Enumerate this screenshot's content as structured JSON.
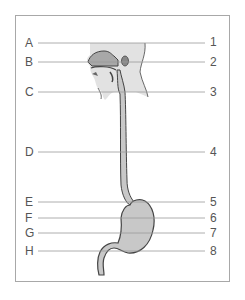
{
  "diagram": {
    "type": "anatomy-labeling",
    "colors": {
      "fill": "#c8c8c8",
      "outline": "#444444",
      "head_fill": "#e2e2e2",
      "leader": "#999999",
      "frame": "#a8a8a8"
    },
    "left_labels": [
      {
        "text": "A",
        "y": 43
      },
      {
        "text": "B",
        "y": 62
      },
      {
        "text": "C",
        "y": 92
      },
      {
        "text": "D",
        "y": 152
      },
      {
        "text": "E",
        "y": 202
      },
      {
        "text": "F",
        "y": 218
      },
      {
        "text": "G",
        "y": 233
      },
      {
        "text": "H",
        "y": 251
      }
    ],
    "right_labels": [
      {
        "text": "1",
        "y": 43
      },
      {
        "text": "2",
        "y": 62
      },
      {
        "text": "3",
        "y": 92
      },
      {
        "text": "4",
        "y": 152
      },
      {
        "text": "5",
        "y": 202
      },
      {
        "text": "6",
        "y": 218
      },
      {
        "text": "7",
        "y": 233
      },
      {
        "text": "8",
        "y": 251
      }
    ]
  }
}
